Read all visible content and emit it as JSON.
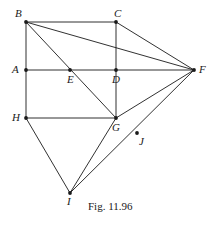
{
  "figure": {
    "caption": "Fig. 11.96",
    "caption_position": {
      "x": 88,
      "y": 200
    },
    "canvas": {
      "width": 214,
      "height": 226
    },
    "stroke_color": "#1a1a1a",
    "background_color": "#ffffff",
    "vertices": [
      {
        "id": "B",
        "label": "B",
        "x": 26,
        "y": 22,
        "label_dx": -11,
        "label_dy": -14
      },
      {
        "id": "C",
        "label": "C",
        "x": 116,
        "y": 22,
        "label_dx": -2,
        "label_dy": -14
      },
      {
        "id": "A",
        "label": "A",
        "x": 26,
        "y": 70,
        "label_dx": -14,
        "label_dy": -6
      },
      {
        "id": "E",
        "label": "E",
        "x": 70,
        "y": 70,
        "label_dx": -3,
        "label_dy": 4
      },
      {
        "id": "D",
        "label": "D",
        "x": 116,
        "y": 70,
        "label_dx": -4,
        "label_dy": 4
      },
      {
        "id": "F",
        "label": "F",
        "x": 194,
        "y": 70,
        "label_dx": 5,
        "label_dy": -6
      },
      {
        "id": "H",
        "label": "H",
        "x": 26,
        "y": 118,
        "label_dx": -14,
        "label_dy": -6
      },
      {
        "id": "G",
        "label": "G",
        "x": 116,
        "y": 118,
        "label_dx": -4,
        "label_dy": 4
      },
      {
        "id": "J",
        "label": "J",
        "x": 137,
        "y": 133,
        "label_dx": 2,
        "label_dy": 3
      },
      {
        "id": "I",
        "label": "I",
        "x": 70,
        "y": 193,
        "label_dx": -3,
        "label_dy": 3
      }
    ],
    "edges": [
      {
        "from": "B",
        "to": "C",
        "name": "segment-bc"
      },
      {
        "from": "B",
        "to": "A",
        "name": "segment-ba"
      },
      {
        "from": "A",
        "to": "H",
        "name": "segment-ah"
      },
      {
        "from": "B",
        "to": "F",
        "name": "segment-bf"
      },
      {
        "from": "B",
        "to": "G",
        "name": "segment-bg"
      },
      {
        "from": "C",
        "to": "F",
        "name": "segment-cf"
      },
      {
        "from": "C",
        "to": "G",
        "name": "segment-cg"
      },
      {
        "from": "A",
        "to": "F",
        "name": "segment-af"
      },
      {
        "from": "H",
        "to": "G",
        "name": "segment-hg"
      },
      {
        "from": "G",
        "to": "F",
        "name": "segment-gf"
      },
      {
        "from": "F",
        "to": "I",
        "name": "segment-fi"
      },
      {
        "from": "G",
        "to": "I",
        "name": "segment-gi"
      },
      {
        "from": "H",
        "to": "I",
        "name": "segment-hi"
      }
    ]
  }
}
